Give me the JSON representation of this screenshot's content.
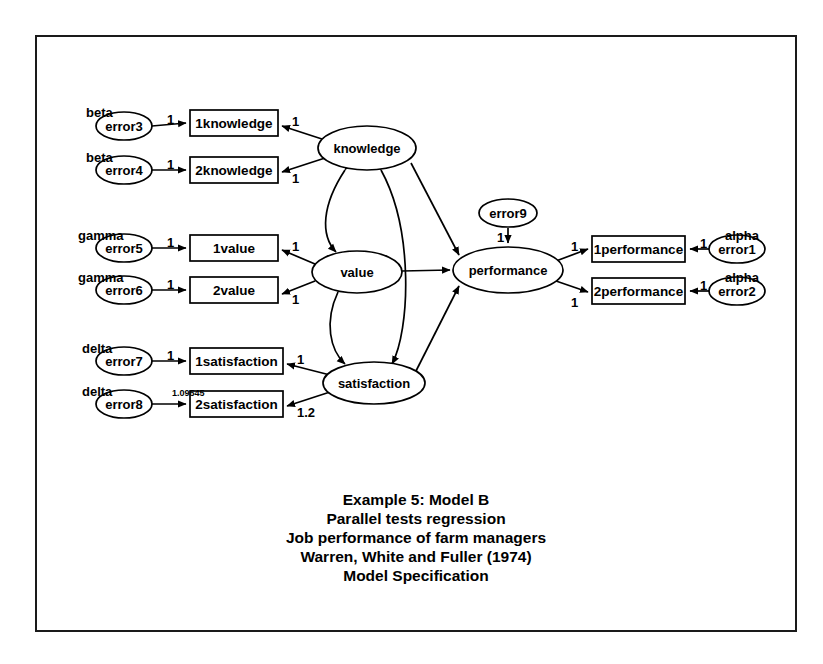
{
  "diagram": {
    "title_lines": [
      "Example 5: Model B",
      "Parallel tests regression",
      "Job performance of farm managers",
      "Warren, White and Fuller (1974)",
      "Model Specification"
    ],
    "latents": [
      {
        "id": "knowledge",
        "label": "knowledge",
        "cx": 367,
        "cy": 148,
        "rx": 49,
        "ry": 22
      },
      {
        "id": "value",
        "label": "value",
        "cx": 357,
        "cy": 272,
        "rx": 45,
        "ry": 21
      },
      {
        "id": "satisfaction",
        "label": "satisfaction",
        "cx": 374,
        "cy": 383,
        "rx": 51,
        "ry": 21
      },
      {
        "id": "performance",
        "label": "performance",
        "cx": 508,
        "cy": 270,
        "rx": 55,
        "ry": 23
      }
    ],
    "indicators": [
      {
        "id": "1knowledge",
        "label": "1knowledge",
        "x": 190,
        "y": 110,
        "w": 88,
        "h": 26
      },
      {
        "id": "2knowledge",
        "label": "2knowledge",
        "x": 190,
        "y": 157,
        "w": 88,
        "h": 26
      },
      {
        "id": "1value",
        "label": "1value",
        "x": 190,
        "y": 235,
        "w": 88,
        "h": 26
      },
      {
        "id": "2value",
        "label": "2value",
        "x": 190,
        "y": 277,
        "w": 88,
        "h": 26
      },
      {
        "id": "1satisfaction",
        "label": "1satisfaction",
        "x": 190,
        "y": 348,
        "w": 93,
        "h": 26
      },
      {
        "id": "2satisfaction",
        "label": "2satisfaction",
        "x": 190,
        "y": 391,
        "w": 93,
        "h": 26
      },
      {
        "id": "1performance",
        "label": "1performance",
        "x": 592,
        "y": 236,
        "w": 93,
        "h": 26
      },
      {
        "id": "2performance",
        "label": "2performance",
        "x": 592,
        "y": 278,
        "w": 93,
        "h": 26
      }
    ],
    "errors": [
      {
        "id": "error3",
        "label": "error3",
        "cx": 124,
        "cy": 126,
        "rx": 28,
        "ry": 14,
        "greek": "beta",
        "greek_x": 86,
        "greek_y": 105
      },
      {
        "id": "error4",
        "label": "error4",
        "cx": 124,
        "cy": 170,
        "rx": 28,
        "ry": 14,
        "greek": "beta",
        "greek_x": 86,
        "greek_y": 150
      },
      {
        "id": "error5",
        "label": "error5",
        "cx": 124,
        "cy": 248,
        "rx": 28,
        "ry": 14,
        "greek": "gamma",
        "greek_x": 78,
        "greek_y": 228
      },
      {
        "id": "error6",
        "label": "error6",
        "cx": 124,
        "cy": 290,
        "rx": 28,
        "ry": 14,
        "greek": "gamma",
        "greek_x": 78,
        "greek_y": 270
      },
      {
        "id": "error7",
        "label": "error7",
        "cx": 124,
        "cy": 361,
        "rx": 28,
        "ry": 14,
        "greek": "delta",
        "greek_x": 82,
        "greek_y": 341
      },
      {
        "id": "error8",
        "label": "error8",
        "cx": 124,
        "cy": 404,
        "rx": 28,
        "ry": 14,
        "greek": "delta",
        "greek_x": 82,
        "greek_y": 384
      },
      {
        "id": "error1",
        "label": "error1",
        "cx": 737,
        "cy": 249,
        "rx": 28,
        "ry": 14,
        "greek": "alpha",
        "greek_x": 725,
        "greek_y": 228
      },
      {
        "id": "error2",
        "label": "error2",
        "cx": 737,
        "cy": 291,
        "rx": 28,
        "ry": 14,
        "greek": "alpha",
        "greek_x": 725,
        "greek_y": 270
      },
      {
        "id": "error9",
        "label": "error9",
        "cx": 508,
        "cy": 213,
        "rx": 29,
        "ry": 14,
        "greek": "",
        "greek_x": 0,
        "greek_y": 0
      }
    ],
    "weights": [
      {
        "id": "w-error3",
        "text": "1",
        "x": 167,
        "y": 112
      },
      {
        "id": "w-error4",
        "text": "1",
        "x": 167,
        "y": 157
      },
      {
        "id": "w-error5",
        "text": "1",
        "x": 167,
        "y": 235
      },
      {
        "id": "w-error6",
        "text": "1",
        "x": 167,
        "y": 277
      },
      {
        "id": "w-error7",
        "text": "1",
        "x": 167,
        "y": 348
      },
      {
        "id": "w-error8",
        "text": "1.09545",
        "x": 172,
        "y": 388
      },
      {
        "id": "w-k1",
        "text": "1",
        "x": 292,
        "y": 114
      },
      {
        "id": "w-k2",
        "text": "1",
        "x": 292,
        "y": 171
      },
      {
        "id": "w-v1",
        "text": "1",
        "x": 292,
        "y": 239
      },
      {
        "id": "w-v2",
        "text": "1",
        "x": 292,
        "y": 292
      },
      {
        "id": "w-s1",
        "text": "1",
        "x": 297,
        "y": 352
      },
      {
        "id": "w-s2",
        "text": "1.2",
        "x": 297,
        "y": 405
      },
      {
        "id": "w-error9",
        "text": "1",
        "x": 497,
        "y": 230
      },
      {
        "id": "w-p1",
        "text": "1",
        "x": 571,
        "y": 239
      },
      {
        "id": "w-p2",
        "text": "1",
        "x": 571,
        "y": 295
      },
      {
        "id": "w-error1",
        "text": "1",
        "x": 700,
        "y": 236
      },
      {
        "id": "w-error2",
        "text": "1",
        "x": 700,
        "y": 278
      }
    ]
  }
}
